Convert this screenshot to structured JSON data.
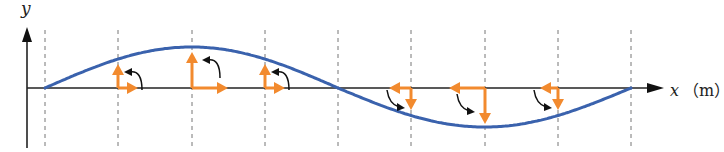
{
  "diagram": {
    "type": "transverse-wave-particle-motion",
    "axes": {
      "y_label": "y",
      "x_label": "x",
      "x_unit": "（m）"
    },
    "colors": {
      "wave": "#3a62ad",
      "velocity_arrows": "#f28a2e",
      "axes": "#222222",
      "dashed_lines": "#777777",
      "rotation_arrows": "#111111"
    },
    "dashed_positions": [
      45,
      118,
      192,
      265,
      338,
      411,
      485,
      558,
      631
    ],
    "wave_points": [
      {
        "x": 45,
        "y": 88
      },
      {
        "x": 118,
        "y": 66
      },
      {
        "x": 192,
        "y": 47
      },
      {
        "x": 265,
        "y": 66
      },
      {
        "x": 338,
        "y": 88
      },
      {
        "x": 411,
        "y": 108
      },
      {
        "x": 485,
        "y": 127
      },
      {
        "x": 558,
        "y": 108
      },
      {
        "x": 631,
        "y": 88
      }
    ],
    "particle_vectors": [
      {
        "x": 118,
        "vy": "up",
        "vy_len": 24,
        "vx": "right",
        "vx_len": 20,
        "rotation": "counterclockwise"
      },
      {
        "x": 192,
        "vy": "up",
        "vy_len": 36,
        "vx": "right",
        "vx_len": 36,
        "rotation": "counterclockwise"
      },
      {
        "x": 265,
        "vy": "up",
        "vy_len": 24,
        "vx": "right",
        "vx_len": 20,
        "rotation": "counterclockwise"
      },
      {
        "x": 411,
        "vy": "down",
        "vy_len": 22,
        "vx": "left",
        "vx_len": 22,
        "rotation": "counterclockwise"
      },
      {
        "x": 485,
        "vy": "down",
        "vy_len": 36,
        "vx": "left",
        "vx_len": 36,
        "rotation": "counterclockwise"
      },
      {
        "x": 558,
        "vy": "down",
        "vy_len": 22,
        "vx": "left",
        "vx_len": 18,
        "rotation": "counterclockwise"
      }
    ]
  }
}
